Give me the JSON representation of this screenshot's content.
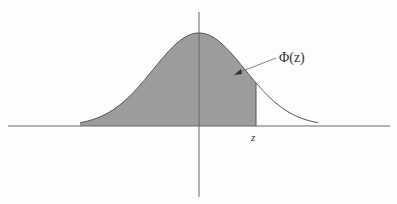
{
  "diagram": {
    "type": "normal-distribution-cdf",
    "labels": {
      "area_label": "Φ(z)",
      "z_label": "z"
    },
    "colors": {
      "shade": "#9c9c9c",
      "curve": "#555555",
      "axis": "#666666",
      "background": "#fdfdfd"
    }
  }
}
